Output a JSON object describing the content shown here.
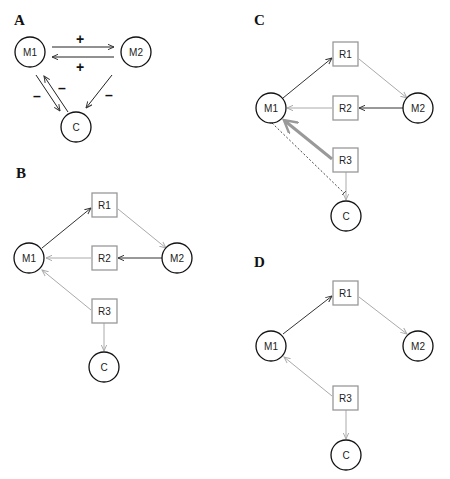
{
  "panels": {
    "A": {
      "label": "A",
      "nodes": {
        "M1": "M1",
        "M2": "M2",
        "C": "C"
      },
      "signs": {
        "m1_to_m2": "+",
        "m2_to_m1": "+",
        "m1_to_c": "–",
        "c_to_m1": "–",
        "m2_to_c": "–"
      }
    },
    "B": {
      "label": "B",
      "nodes": {
        "M1": "M1",
        "M2": "M2",
        "R1": "R1",
        "R2": "R2",
        "R3": "R3",
        "C": "C"
      }
    },
    "C": {
      "label": "C",
      "nodes": {
        "M1": "M1",
        "M2": "M2",
        "R1": "R1",
        "R2": "R2",
        "R3": "R3",
        "C": "C"
      }
    },
    "D": {
      "label": "D",
      "nodes": {
        "M1": "M1",
        "M2": "M2",
        "R1": "R1",
        "R3": "R3",
        "C": "C"
      }
    }
  },
  "colors": {
    "dark_edge": "#333333",
    "light_edge": "#aaaaaa",
    "thick_edge": "#999999",
    "node_stroke": "#111111",
    "box_stroke": "#999999"
  }
}
